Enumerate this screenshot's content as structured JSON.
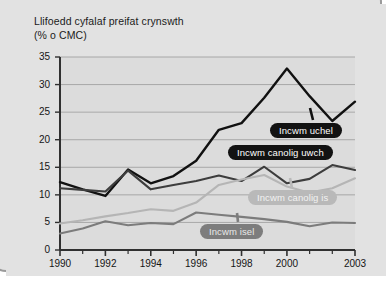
{
  "figure": {
    "title_line1": "Llifoedd cyfalaf preifat crynswth",
    "title_line2": "(% o CMC)"
  },
  "colors": {
    "high_income": "#111111",
    "upper_middle": "#3d3d3d",
    "lower_middle": "#b5b5b5",
    "low_income": "#7c7c7c",
    "plot_background": "#dcdcdc",
    "gridline": "#9b9b9b",
    "axis": "#303030",
    "page_background": "#e2e2e2"
  },
  "callouts": [
    {
      "name": "high-income",
      "label": "Incwm uchel",
      "style": "dark",
      "x": 270,
      "y": 123,
      "pointer_x": 310,
      "pointer_y": 108,
      "pointer_to_x": 313,
      "pointer_to_y": 120
    },
    {
      "name": "upper-middle",
      "label": "Incwm canolig uwch",
      "style": "dark",
      "x": 228,
      "y": 145,
      "pointer_x": 288,
      "pointer_y": 160,
      "pointer_to_x": 288,
      "pointer_to_y": 148
    },
    {
      "name": "lower-middle",
      "label": "Incwm canolig is",
      "style": "light",
      "x": 248,
      "y": 190,
      "pointer_x": 290,
      "pointer_y": 178,
      "pointer_to_x": 292,
      "pointer_to_y": 188
    },
    {
      "name": "low-income",
      "label": "Incwm isel",
      "style": "mid",
      "x": 200,
      "y": 224,
      "pointer_x": 237,
      "pointer_y": 213,
      "pointer_to_x": 238,
      "pointer_to_y": 222
    }
  ],
  "chart_data": {
    "type": "line",
    "title": "Llifoedd cyfalaf preifat crynswth (% o CMC)",
    "xlabel": "",
    "ylabel": "% o CMC",
    "grid": true,
    "legend_position": "inline-callouts",
    "xlim": [
      1990,
      2003
    ],
    "ylim": [
      0,
      35
    ],
    "ytick_labels": [
      "0",
      "5",
      "10",
      "15",
      "20",
      "25",
      "30",
      "35"
    ],
    "ytick_values": [
      0,
      5,
      10,
      15,
      20,
      25,
      30,
      35
    ],
    "xtick_values": [
      1990,
      1991,
      1992,
      1993,
      1994,
      1995,
      1996,
      1997,
      1998,
      1999,
      2000,
      2001,
      2002,
      2003
    ],
    "xtick_labels_shown": [
      "1990",
      "1992",
      "1994",
      "1996",
      "1998",
      "2000",
      "2003"
    ],
    "x": [
      1990,
      1991,
      1992,
      1993,
      1994,
      1995,
      1996,
      1997,
      1998,
      1999,
      2000,
      2001,
      2002,
      2003
    ],
    "series": [
      {
        "name": "Incwm uchel",
        "color": "#111111",
        "width": 2.4,
        "values": [
          12.3,
          11.0,
          9.8,
          14.6,
          12.1,
          13.4,
          16.2,
          21.8,
          23.0,
          27.6,
          32.9,
          27.9,
          23.4,
          26.9
        ]
      },
      {
        "name": "Incwm canolig uwch",
        "color": "#3d3d3d",
        "width": 2.1,
        "values": [
          11.2,
          10.9,
          10.6,
          14.4,
          11.0,
          11.8,
          12.5,
          13.5,
          12.5,
          15.1,
          12.1,
          12.9,
          15.4,
          14.5
        ]
      },
      {
        "name": "Incwm canolig is",
        "color": "#b5b5b5",
        "width": 2.1,
        "values": [
          4.8,
          5.4,
          6.1,
          6.7,
          7.4,
          7.1,
          8.6,
          11.8,
          12.8,
          13.6,
          11.5,
          10.4,
          11.2,
          13.0
        ]
      },
      {
        "name": "Incwm isel",
        "color": "#7c7c7c",
        "width": 2.1,
        "values": [
          3.0,
          3.9,
          5.2,
          4.5,
          4.9,
          4.7,
          6.8,
          6.4,
          6.0,
          5.6,
          5.1,
          4.3,
          5.0,
          4.9
        ]
      }
    ]
  }
}
